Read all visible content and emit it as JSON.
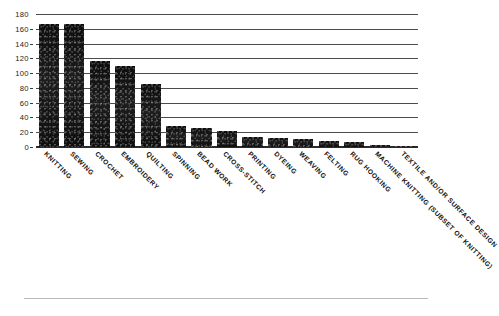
{
  "chart_data": {
    "type": "bar",
    "title": "",
    "subtitle": "",
    "xlabel": "",
    "ylabel": "",
    "ylim": [
      0,
      180
    ],
    "yticks": [
      0,
      20,
      40,
      60,
      80,
      100,
      120,
      140,
      160,
      180
    ],
    "grid": true,
    "legend": false,
    "orientation": "vertical",
    "bar_color": "#141414",
    "categories": [
      "KNITTING",
      "SEWING",
      "CROCHET",
      "EMBROIDERY",
      "QUILTING",
      "SPINNING",
      "BEAD WORK",
      "CROSS-STITCH",
      "PRINTING",
      "DYEING",
      "WEAVING",
      "FELTING",
      "RUG HOOKING",
      "MACHINE KNITTING (SUBSET OF KNITTING)",
      "TEXTILE AND/OR SURFACE DESIGN"
    ],
    "values": [
      166,
      167,
      117,
      110,
      85,
      28,
      26,
      21,
      13,
      12,
      11,
      8,
      7,
      3,
      1
    ]
  },
  "axes": {
    "y_tick_labels": [
      "180",
      "160",
      "140",
      "120",
      "100",
      "80",
      "60",
      "40",
      "20",
      "0"
    ]
  },
  "footer": {
    "rule": ""
  }
}
